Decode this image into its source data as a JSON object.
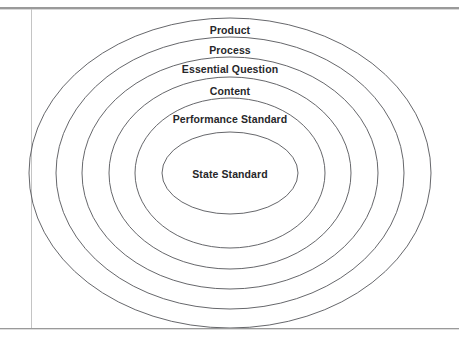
{
  "page": {
    "width": 459,
    "height": 342,
    "background_color": "#ffffff",
    "frame": {
      "top_rule_color": "#9a9a9a",
      "bottom_rule_color": "#9a9a9a",
      "left_rule_color": "#c4c4c4"
    }
  },
  "diagram": {
    "type": "nested-concentric-ellipses",
    "title": "",
    "center": {
      "x": 230,
      "y": 173
    },
    "stroke_color": "#55565a",
    "stroke_width": 0.9,
    "fill": "none",
    "label_color": "#27272a",
    "rings": [
      {
        "label": "Product",
        "level": 1,
        "position": "outermost",
        "rx": 201,
        "ry": 155,
        "label_x": 230,
        "label_y": 30,
        "font_size": 10.5
      },
      {
        "label": "Process",
        "level": 2,
        "rx": 174,
        "ry": 136,
        "label_x": 230,
        "label_y": 50,
        "font_size": 10.5
      },
      {
        "label": "Essential Question",
        "level": 3,
        "rx": 148,
        "ry": 116,
        "label_x": 230,
        "label_y": 69,
        "font_size": 10.5
      },
      {
        "label": "Content",
        "level": 4,
        "rx": 121,
        "ry": 96,
        "label_x": 230,
        "label_y": 91,
        "font_size": 10.5
      },
      {
        "label": "Performance Standard",
        "level": 5,
        "rx": 95,
        "ry": 75,
        "label_x": 230,
        "label_y": 119,
        "font_size": 10.5
      },
      {
        "label": "State Standard",
        "level": 6,
        "position": "innermost",
        "rx": 68,
        "ry": 41,
        "label_x": 230,
        "label_y": 174,
        "font_size": 10.5
      }
    ]
  }
}
